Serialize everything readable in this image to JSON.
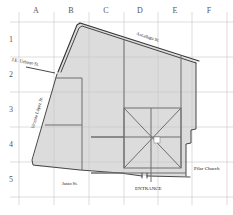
{
  "map": {
    "grid": {
      "columns": [
        "A",
        "B",
        "C",
        "D",
        "E",
        "F"
      ],
      "rows": [
        "1",
        "2",
        "3",
        "4",
        "5"
      ]
    },
    "streets": {
      "north": "Ascañaga St.",
      "northwest": "J.E. Urbano St.",
      "west": "Vicente López St.",
      "south": "Justo St."
    },
    "landmarks": {
      "church": "Pilar Church",
      "entrance": "ENTRANCE"
    },
    "colors": {
      "block_fill": "#dcdcdc",
      "border": "#333333",
      "path": "#6e6e6e",
      "grid": "#c8c8c8",
      "background": "#ffffff"
    }
  }
}
